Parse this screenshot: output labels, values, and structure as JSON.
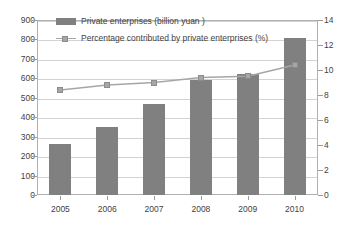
{
  "chart_data": {
    "type": "bar",
    "title": "",
    "xlabel": "",
    "ylabel": "",
    "grid": true,
    "legend_position": "top-left-inside",
    "categories": [
      "2005",
      "2006",
      "2007",
      "2008",
      "2009",
      "2010"
    ],
    "series": [
      {
        "name": "Private enterprises (billion yuan )",
        "type": "bar",
        "axis": "left",
        "unit": "billion yuan",
        "color": "#808080",
        "values": [
          260,
          350,
          470,
          590,
          620,
          810
        ]
      },
      {
        "name": "Percentage contributed by private enterprises (%)",
        "type": "line",
        "axis": "right",
        "unit": "%",
        "color": "#a6a6a6",
        "values": [
          8.4,
          8.8,
          9.0,
          9.4,
          9.5,
          10.4
        ]
      }
    ],
    "left_axis": {
      "ylim": [
        0,
        900
      ],
      "tick_step": 100,
      "ticks": [
        "0",
        "100",
        "200",
        "300",
        "400",
        "500",
        "600",
        "700",
        "800",
        "900"
      ]
    },
    "right_axis": {
      "ylim": [
        0,
        14
      ],
      "tick_step": 2,
      "ticks": [
        "0",
        "2",
        "4",
        "6",
        "8",
        "10",
        "12",
        "14"
      ]
    }
  },
  "legend": {
    "entries": [
      {
        "label": "Private enterprises (billion yuan )",
        "swatch": "bar-swatch"
      },
      {
        "label": "Percentage contributed by private enterprises (%)",
        "swatch": "line-marker-swatch"
      }
    ]
  },
  "colors": {
    "bar": "#808080",
    "line": "#a6a6a6",
    "grid": "#d3d3d3",
    "frame": "#b0b0b0",
    "text": "#3f3f3f",
    "background": "#ffffff"
  }
}
